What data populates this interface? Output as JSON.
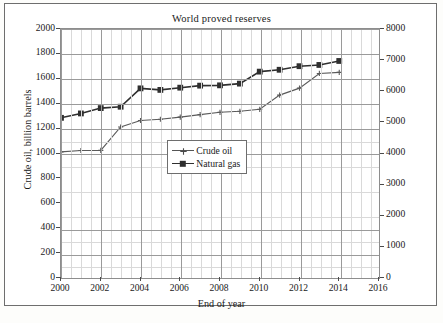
{
  "chart_data": {
    "type": "line",
    "title": "World proved reserves",
    "xlabel": "End of year",
    "ylabel": "Crude oil, billion barrels",
    "ylabel_right": "Natural gas, trillion cubic feet",
    "grid": true,
    "legend_position": "center",
    "xlim": [
      2000,
      2016
    ],
    "ylim": [
      0,
      2000
    ],
    "ylim_right": [
      0,
      8000
    ],
    "xticks": [
      "2000",
      "2002",
      "2004",
      "2006",
      "2008",
      "2010",
      "2012",
      "2014",
      "2016"
    ],
    "yticks": [
      "0",
      "200",
      "400",
      "600",
      "800",
      "1000",
      "1200",
      "1400",
      "1600",
      "1800",
      "2000"
    ],
    "yticks_right": [
      "0",
      "1000",
      "2000",
      "3000",
      "4000",
      "5000",
      "6000",
      "7000",
      "8000"
    ],
    "x": [
      2000,
      2001,
      2002,
      2003,
      2004,
      2005,
      2006,
      2007,
      2008,
      2009,
      2010,
      2011,
      2012,
      2013,
      2014
    ],
    "series": [
      {
        "name": "Crude oil",
        "axis": "left",
        "unit": "billion barrels",
        "marker": "plus",
        "color": "#5a5a5a",
        "values": [
          1013,
          1024,
          1025,
          1213,
          1265,
          1275,
          1292,
          1312,
          1331,
          1339,
          1355,
          1469,
          1525,
          1643,
          1652
        ]
      },
      {
        "name": "Natural gas",
        "axis": "right",
        "unit": "trillion cubic feet",
        "marker": "square",
        "color": "#2f2f2f",
        "values": [
          5146,
          5287,
          5459,
          5503,
          6093,
          6043,
          6115,
          6180,
          6190,
          6245,
          6630,
          6690,
          6805,
          6845,
          6973
        ]
      }
    ]
  },
  "axis_titles": {
    "left": "Crude oil, billion barrels",
    "right": "Natural gas, trillion cubic feet",
    "bottom": "End of year"
  },
  "legend": {
    "items": [
      {
        "label": "Crude oil"
      },
      {
        "label": "Natural gas"
      }
    ]
  }
}
